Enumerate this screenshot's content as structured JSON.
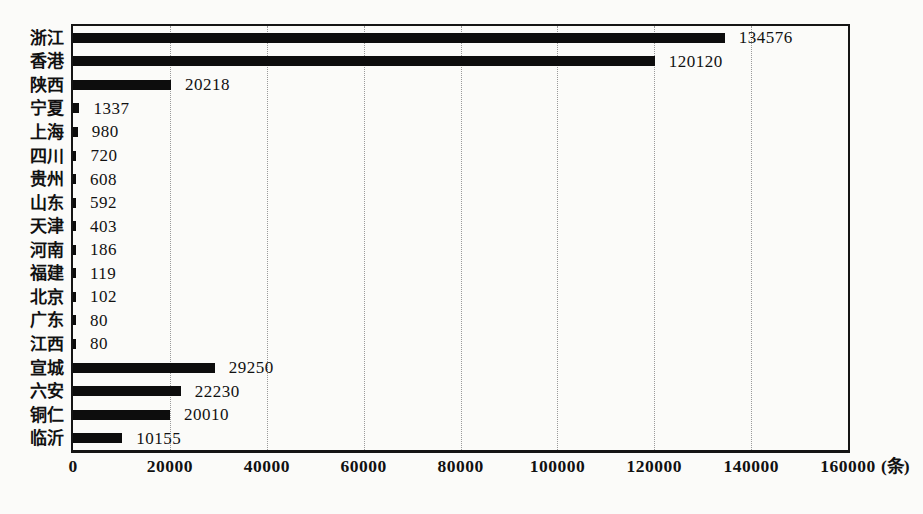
{
  "chart_data": {
    "type": "bar",
    "orientation": "horizontal",
    "title": "",
    "xlabel": "",
    "ylabel": "",
    "unit_label": "(条)",
    "categories": [
      "浙江",
      "香港",
      "陕西",
      "宁夏",
      "上海",
      "四川",
      "贵州",
      "山东",
      "天津",
      "河南",
      "福建",
      "北京",
      "广东",
      "江西",
      "宣城",
      "六安",
      "铜仁",
      "临沂"
    ],
    "values": [
      134576,
      120120,
      20218,
      1337,
      980,
      720,
      608,
      592,
      403,
      186,
      119,
      102,
      80,
      80,
      29250,
      22230,
      20010,
      10155
    ],
    "value_labels": [
      "134576",
      "120120",
      "20218",
      "1337",
      "980",
      "720",
      "608",
      "592",
      "403",
      "186",
      "119",
      "102",
      "80",
      "80",
      "29250",
      "22230",
      "20010",
      "10155"
    ],
    "x_ticks": [
      "0",
      "20000",
      "40000",
      "60000",
      "80000",
      "100000",
      "120000",
      "140000",
      "160000"
    ],
    "x_tick_values": [
      0,
      20000,
      40000,
      60000,
      80000,
      100000,
      120000,
      140000,
      160000
    ],
    "xlim": [
      0,
      160000
    ],
    "grid": "vertical-dotted",
    "legend": "none",
    "colors": {
      "bar": "#0d0d0d",
      "gridline": "#9a9a9a",
      "border": "#151515",
      "text": "#111111",
      "background": "#fbfbf9"
    }
  }
}
